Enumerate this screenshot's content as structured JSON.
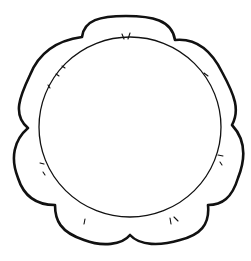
{
  "image": {
    "description": "Line-art scalloped flower frame with inner circle",
    "background_color": "#ffffff",
    "stroke_color": "#111111"
  }
}
